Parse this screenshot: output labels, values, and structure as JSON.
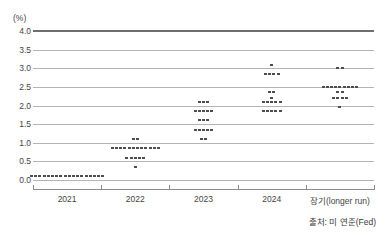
{
  "chart_data": {
    "type": "scatter",
    "title": "",
    "subtitle": "",
    "xlabel": "",
    "ylabel": "(%)",
    "unit_label": "(%)",
    "ylim": [
      0.0,
      4.0
    ],
    "ytick_values": [
      4.0,
      3.5,
      3.0,
      2.5,
      2.0,
      1.5,
      1.0,
      0.5,
      0.0
    ],
    "ytick_labels": [
      "4.0",
      "3.5",
      "3.0",
      "2.5",
      "2.0",
      "1.5",
      "1.0",
      "0.5",
      "0.0"
    ],
    "grid": true,
    "legend": "none",
    "categories": [
      "2021",
      "2022",
      "2023",
      "2024",
      "장기(longer run)"
    ],
    "series": [
      {
        "name": "2021",
        "dots": [
          {
            "value": 0.1,
            "count": 18
          }
        ]
      },
      {
        "name": "2022",
        "dots": [
          {
            "value": 1.1,
            "count": 2
          },
          {
            "value": 0.85,
            "count": 12
          },
          {
            "value": 0.6,
            "count": 5
          },
          {
            "value": 0.35,
            "count": 1
          }
        ]
      },
      {
        "name": "2023",
        "dots": [
          {
            "value": 2.1,
            "count": 3
          },
          {
            "value": 1.85,
            "count": 5
          },
          {
            "value": 1.6,
            "count": 3
          },
          {
            "value": 1.35,
            "count": 5
          },
          {
            "value": 1.1,
            "count": 2
          }
        ]
      },
      {
        "name": "2024",
        "dots": [
          {
            "value": 3.1,
            "count": 1
          },
          {
            "value": 2.85,
            "count": 4
          },
          {
            "value": 2.35,
            "count": 2
          },
          {
            "value": 2.2,
            "count": 1
          },
          {
            "value": 2.1,
            "count": 5
          },
          {
            "value": 1.85,
            "count": 5
          }
        ]
      },
      {
        "name": "장기(longer run)",
        "dots": [
          {
            "value": 3.0,
            "count": 2
          },
          {
            "value": 2.5,
            "count": 9
          },
          {
            "value": 2.35,
            "count": 2
          },
          {
            "value": 2.2,
            "count": 4
          },
          {
            "value": 1.95,
            "count": 1
          }
        ]
      }
    ]
  },
  "source": {
    "text": "출처: 미 연준(Fed)"
  },
  "colors": {
    "dot": "#4d4d4d",
    "grid": "#b4b4b4",
    "top_border": "#6e6e6e",
    "axis": "#8c8c8c",
    "text": "#3a3a3a",
    "background": "#ffffff"
  }
}
